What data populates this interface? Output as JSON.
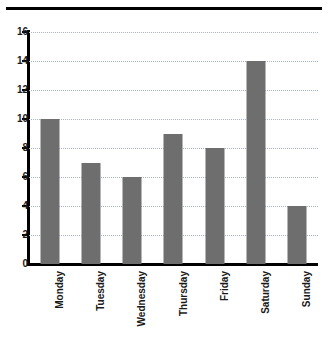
{
  "chart_data": {
    "type": "bar",
    "title": "",
    "xlabel": "",
    "ylabel": "",
    "categories": [
      "Monday",
      "Tuesday",
      "Wednesday",
      "Thursday",
      "Friday",
      "Saturday",
      "Sunday"
    ],
    "values": [
      10,
      7,
      6,
      9,
      8,
      14,
      4
    ],
    "ylim": [
      0,
      16
    ],
    "ytick_labels": [
      "0",
      "2",
      "4",
      "6",
      "8",
      "10",
      "12",
      "14",
      "16"
    ],
    "ytick_values": [
      0,
      2,
      4,
      6,
      8,
      10,
      12,
      14,
      16
    ],
    "grid": true,
    "grid_axis": "y",
    "grid_style": "dotted",
    "legend": false,
    "bar_color": "#6e6e6e",
    "grid_color": "#a8b4c8",
    "axis_color": "#000000",
    "xtick_label_rotation": 90
  }
}
